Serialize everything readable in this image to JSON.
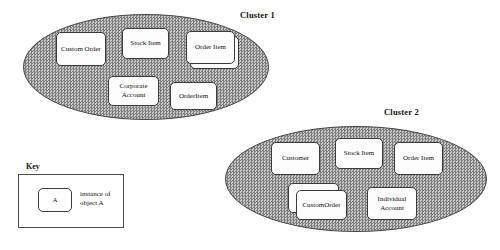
{
  "diagram": {
    "type": "object-cluster-diagram",
    "clusters": [
      {
        "name": "cluster-1",
        "label": "Cluster 1",
        "label_pos": {
          "x": 240,
          "y": 10
        },
        "ellipse": {
          "x": 23,
          "y": 14,
          "w": 246,
          "h": 106
        },
        "objects": [
          {
            "name": "custom-order",
            "label": "Custom Order",
            "x": 56,
            "y": 32,
            "w": 50,
            "h": 34,
            "stacked": false
          },
          {
            "name": "stock-item",
            "label": "Stock Item",
            "x": 122,
            "y": 28,
            "w": 47,
            "h": 31,
            "stacked": false
          },
          {
            "name": "order-item",
            "label": "Order Item",
            "x": 186,
            "y": 31,
            "w": 49,
            "h": 33,
            "stacked": true,
            "stack_dx": 4,
            "stack_dy": 5
          },
          {
            "name": "corporate-account",
            "label": "Corporate\nAccount",
            "x": 108,
            "y": 76,
            "w": 51,
            "h": 30,
            "stacked": false
          },
          {
            "name": "order-item-2",
            "label": "OrderItem",
            "x": 170,
            "y": 82,
            "w": 47,
            "h": 28,
            "stacked": false
          }
        ]
      },
      {
        "name": "cluster-2",
        "label": "Cluster 2",
        "label_pos": {
          "x": 384,
          "y": 107
        },
        "ellipse": {
          "x": 225,
          "y": 126,
          "w": 262,
          "h": 106
        },
        "objects": [
          {
            "name": "customer",
            "label": "Customer",
            "x": 271,
            "y": 142,
            "w": 49,
            "h": 33,
            "stacked": false
          },
          {
            "name": "stock-item",
            "label": "Stock Item",
            "x": 335,
            "y": 138,
            "w": 48,
            "h": 31,
            "stacked": false
          },
          {
            "name": "order-item",
            "label": "Order Item",
            "x": 394,
            "y": 142,
            "w": 49,
            "h": 33,
            "stacked": false
          },
          {
            "name": "custom-order",
            "label": "CustomOrder",
            "x": 296,
            "y": 190,
            "w": 51,
            "h": 30,
            "stacked": true,
            "stack_dx": -8,
            "stack_dy": -7
          },
          {
            "name": "individual-account",
            "label": "Individual\nAccount",
            "x": 367,
            "y": 187,
            "w": 50,
            "h": 33,
            "stacked": false
          }
        ]
      }
    ]
  },
  "key": {
    "label": "Key",
    "label_pos": {
      "x": 26,
      "y": 162
    },
    "box": {
      "x": 18,
      "y": 174,
      "w": 106,
      "h": 54
    },
    "sample": {
      "label": "A",
      "x": 38,
      "y": 188,
      "w": 34,
      "h": 24
    },
    "caption": "instance of\nobject A",
    "caption_pos": {
      "x": 80,
      "y": 190
    }
  },
  "colors": {
    "cluster_fill": "#9c9c9c",
    "cluster_stroke": "#4a4a4a",
    "box_fill": "#fdfdfd",
    "box_stroke": "#3a3a3a",
    "text": "#101010",
    "background": "#ffffff"
  }
}
